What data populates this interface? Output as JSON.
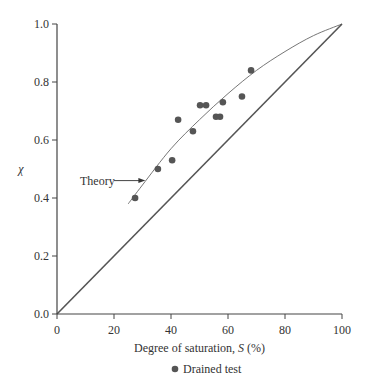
{
  "chart_data": {
    "type": "scatter",
    "title": "",
    "xlabel": "Degree of saturation, S (%)",
    "xlabel_prefix": "Degree of saturation, ",
    "xlabel_var": "S",
    "xlabel_suffix": " (%)",
    "ylabel": "χ",
    "xlim": [
      0,
      100
    ],
    "ylim": [
      0.0,
      1.0
    ],
    "xticks": [
      "0",
      "20",
      "40",
      "60",
      "80",
      "100"
    ],
    "yticks": [
      "0.0",
      "0.2",
      "0.4",
      "0.6",
      "0.8",
      "1.0"
    ],
    "grid": false,
    "legend_position": "bottom-center",
    "series": [
      {
        "name": "Drained test",
        "type": "scatter",
        "marker": "filled-circle",
        "color": "#555555",
        "x": [
          27.4,
          35.4,
          40.4,
          42.5,
          47.7,
          50.2,
          52.3,
          55.8,
          57.2,
          58.2,
          64.9,
          68.1
        ],
        "y": [
          0.4,
          0.5,
          0.53,
          0.67,
          0.63,
          0.72,
          0.72,
          0.68,
          0.68,
          0.73,
          0.75,
          0.84
        ]
      },
      {
        "name": "Theory",
        "type": "line",
        "color": "#666666",
        "x": [
          25,
          30,
          40,
          50,
          60,
          70,
          80,
          90,
          100
        ],
        "y": [
          0.38,
          0.445,
          0.57,
          0.67,
          0.76,
          0.84,
          0.905,
          0.96,
          1.0
        ]
      },
      {
        "name": "χ = S (reference)",
        "type": "line",
        "color": "#555555",
        "x": [
          0,
          100
        ],
        "y": [
          0.0,
          1.0
        ]
      }
    ],
    "annotations": [
      {
        "text": "Theory",
        "arrow_to": [
          31,
          0.46
        ]
      }
    ]
  },
  "legend": {
    "items": [
      {
        "label": "Drained test",
        "marker": "filled-circle"
      }
    ]
  }
}
